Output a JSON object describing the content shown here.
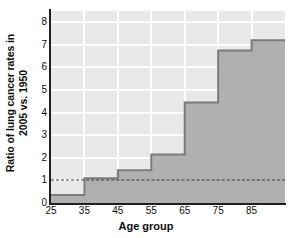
{
  "chart_data": {
    "type": "area",
    "title": "",
    "subtitle": "",
    "xlabel": "Age group",
    "ylabel": "Ratio of lung cancer rates in 2005 vs. 1950",
    "ylabel_line1": "Ratio of lung cancer rates in",
    "ylabel_line2": "2005 vs. 1950",
    "categories": [
      "25",
      "35",
      "45",
      "55",
      "65",
      "75",
      "85"
    ],
    "x": [
      25,
      35,
      45,
      55,
      65,
      75,
      85
    ],
    "values": [
      0.35,
      1.1,
      1.45,
      2.15,
      4.45,
      6.75,
      7.2
    ],
    "step_style": "post",
    "xlim": [
      25,
      95
    ],
    "ylim": [
      0,
      8.5
    ],
    "xticks": [
      "25",
      "35",
      "45",
      "55",
      "65",
      "75",
      "85"
    ],
    "yticks": [
      "0",
      "1",
      "2",
      "3",
      "4",
      "5",
      "6",
      "7",
      "8"
    ],
    "grid": true,
    "grid_color": "#fdfdfd",
    "legend": "none",
    "annotations": [
      {
        "name": "reference-line",
        "type": "horizontal-dashed-line",
        "value": 1,
        "style": "dashed",
        "color": "#39393c"
      }
    ],
    "colors": {
      "fill": "#b0b0b0",
      "edge": "#7b7b7b",
      "plot_background": "#e9e9e9",
      "grid": "#fdfdfd",
      "axis": "#1f1f1f",
      "text": "#0d0d0d",
      "reference_line": "#39393c"
    }
  }
}
